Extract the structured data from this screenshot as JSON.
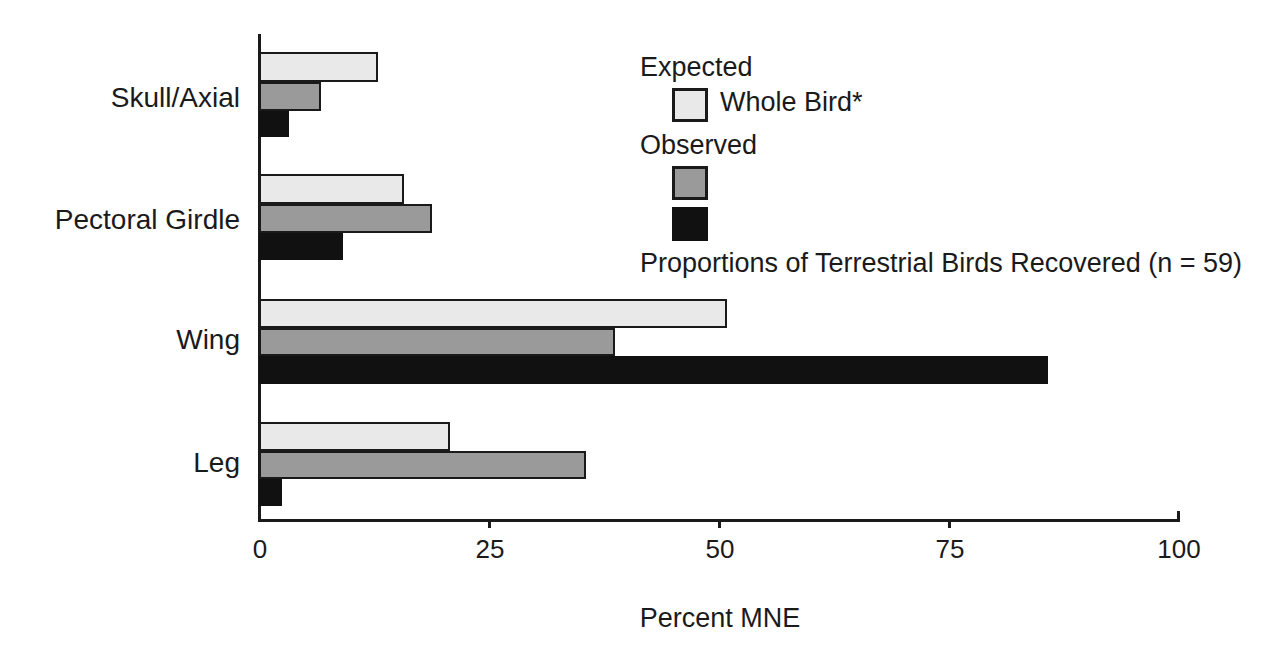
{
  "chart_data": {
    "type": "bar",
    "orientation": "horizontal",
    "title": "",
    "xlabel": "Percent MNE",
    "ylabel": "",
    "xlim": [
      0,
      100
    ],
    "xticks": [
      "0",
      "25",
      "50",
      "75",
      "100"
    ],
    "xtick_values": [
      0,
      25,
      50,
      75,
      100
    ],
    "grid": false,
    "categories": [
      "Skull/Axial",
      "Pectoral Girdle",
      "Wing",
      "Leg"
    ],
    "series": [
      {
        "name": "Whole Bird*",
        "group": "Expected",
        "color": "#e9e9e9",
        "values": [
          13,
          15.8,
          51,
          20.8
        ]
      },
      {
        "name": "Observed (gray)",
        "group": "Observed",
        "color": "#9a9a9a",
        "values": [
          6.8,
          18.8,
          38.8,
          35.6
        ]
      },
      {
        "name": "Observed (black)",
        "group": "Observed",
        "color": "#111111",
        "values": [
          3.3,
          9.2,
          86,
          2.5
        ]
      }
    ],
    "legend_position": "upper-right",
    "annotations": [
      "Proportions of Terrestrial Birds Recovered (n = 59)"
    ]
  },
  "axis": {
    "x_title": "Percent MNE",
    "ticks": [
      "0",
      "25",
      "50",
      "75",
      "100"
    ]
  },
  "categories": [
    {
      "label": "Skull/Axial"
    },
    {
      "label": "Pectoral Girdle"
    },
    {
      "label": "Wing"
    },
    {
      "label": "Leg"
    }
  ],
  "legend": {
    "expected_header": "Expected",
    "expected_item": "Whole Bird*",
    "observed_header": "Observed",
    "caption": "Proportions of Terrestrial Birds Recovered (n = 59)"
  },
  "colors": {
    "expected_fill": "#e9e9e9",
    "observed_gray_fill": "#9a9a9a",
    "observed_black_fill": "#111111",
    "ink": "#1a1a1a",
    "background": "#ffffff"
  }
}
